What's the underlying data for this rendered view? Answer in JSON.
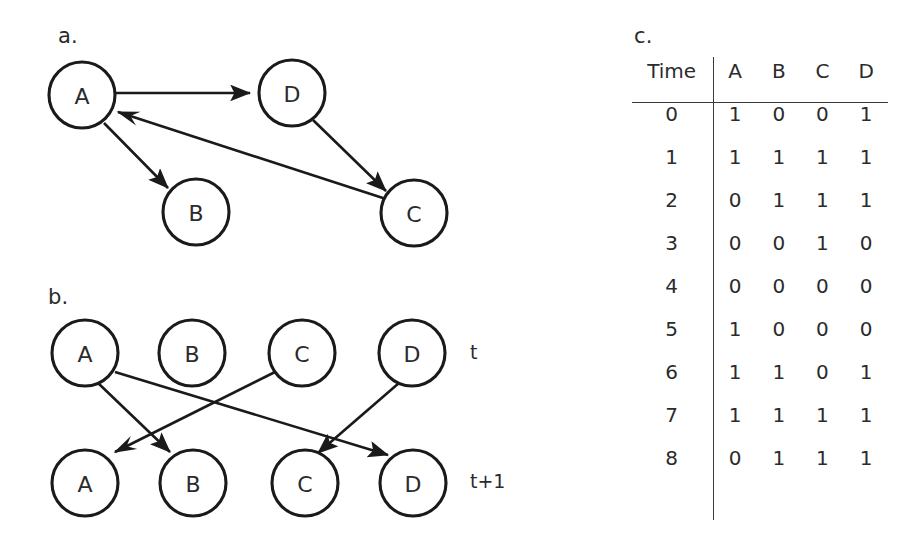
{
  "figure": {
    "panels": [
      {
        "id": "a",
        "label": "a."
      },
      {
        "id": "b",
        "label": "b."
      },
      {
        "id": "c",
        "label": "c."
      }
    ]
  },
  "panel_a": {
    "label": "a.",
    "nodes": [
      {
        "id": "A",
        "label": "A",
        "cx": 82,
        "cy": 95,
        "r": 33
      },
      {
        "id": "D",
        "label": "D",
        "cx": 292,
        "cy": 93,
        "r": 33
      },
      {
        "id": "B",
        "label": "B",
        "cx": 196,
        "cy": 212,
        "r": 33
      },
      {
        "id": "C",
        "label": "C",
        "cx": 414,
        "cy": 213,
        "r": 33
      }
    ],
    "edges": [
      {
        "from": "A",
        "to": "D"
      },
      {
        "from": "A",
        "to": "B"
      },
      {
        "from": "D",
        "to": "C"
      },
      {
        "from": "C",
        "to": "A"
      }
    ]
  },
  "panel_b": {
    "label": "b.",
    "row_labels": {
      "top": "t",
      "bottom": "t+1"
    },
    "nodes_top": [
      {
        "id": "A_t",
        "label": "A",
        "cx": 85,
        "cy": 353,
        "r": 33
      },
      {
        "id": "B_t",
        "label": "B",
        "cx": 192,
        "cy": 353,
        "r": 33
      },
      {
        "id": "C_t",
        "label": "C",
        "cx": 302,
        "cy": 353,
        "r": 33
      },
      {
        "id": "D_t",
        "label": "D",
        "cx": 412,
        "cy": 353,
        "r": 33
      }
    ],
    "nodes_bottom": [
      {
        "id": "A_t1",
        "label": "A",
        "cx": 85,
        "cy": 483,
        "r": 33
      },
      {
        "id": "B_t1",
        "label": "B",
        "cx": 193,
        "cy": 483,
        "r": 33
      },
      {
        "id": "C_t1",
        "label": "C",
        "cx": 305,
        "cy": 483,
        "r": 33
      },
      {
        "id": "D_t1",
        "label": "D",
        "cx": 413,
        "cy": 483,
        "r": 33
      }
    ],
    "edges": [
      {
        "from": "A_t",
        "to": "B_t1"
      },
      {
        "from": "A_t",
        "to": "D_t1"
      },
      {
        "from": "C_t",
        "to": "A_t1"
      },
      {
        "from": "D_t",
        "to": "C_t1"
      }
    ]
  },
  "panel_c": {
    "label": "c.",
    "columns": [
      "Time",
      "A",
      "B",
      "C",
      "D"
    ],
    "rows": [
      {
        "time": "0",
        "values": [
          "1",
          "0",
          "0",
          "1"
        ]
      },
      {
        "time": "1",
        "values": [
          "1",
          "1",
          "1",
          "1"
        ]
      },
      {
        "time": "2",
        "values": [
          "0",
          "1",
          "1",
          "1"
        ]
      },
      {
        "time": "3",
        "values": [
          "0",
          "0",
          "1",
          "0"
        ]
      },
      {
        "time": "4",
        "values": [
          "0",
          "0",
          "0",
          "0"
        ]
      },
      {
        "time": "5",
        "values": [
          "1",
          "0",
          "0",
          "0"
        ]
      },
      {
        "time": "6",
        "values": [
          "1",
          "1",
          "0",
          "1"
        ]
      },
      {
        "time": "7",
        "values": [
          "1",
          "1",
          "1",
          "1"
        ]
      },
      {
        "time": "8",
        "values": [
          "0",
          "1",
          "1",
          "1"
        ]
      }
    ]
  },
  "colors": {
    "ink": "#231f20",
    "stroke": "#1a1a1a",
    "background": "#ffffff"
  }
}
